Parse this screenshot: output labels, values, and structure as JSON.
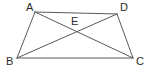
{
  "figure": {
    "kind": "geometry-diagram",
    "shape_name": "quadrilateral",
    "canvas": {
      "width": 148,
      "height": 72
    },
    "background_color": "#ffffff",
    "stroke_color": "#5a5a5a",
    "label_color": "#2b2b2b",
    "points": [
      {
        "id": "A",
        "label": "A",
        "x": 35,
        "y": 12,
        "label_x": 26,
        "label_y": 2
      },
      {
        "id": "D",
        "label": "D",
        "x": 117,
        "y": 14,
        "label_x": 120,
        "label_y": 2
      },
      {
        "id": "B",
        "label": "B",
        "x": 17,
        "y": 58,
        "label_x": 6,
        "label_y": 56
      },
      {
        "id": "C",
        "label": "C",
        "x": 133,
        "y": 58,
        "label_x": 136,
        "label_y": 56
      },
      {
        "id": "E",
        "label": "E",
        "x": 74,
        "y": 34,
        "label_x": 71,
        "label_y": 16
      }
    ],
    "segments": [
      {
        "id": "AD",
        "from": "A",
        "to": "D",
        "role": "side"
      },
      {
        "id": "AB",
        "from": "A",
        "to": "B",
        "role": "side"
      },
      {
        "id": "DC",
        "from": "D",
        "to": "C",
        "role": "side"
      },
      {
        "id": "BC",
        "from": "B",
        "to": "C",
        "role": "side"
      },
      {
        "id": "AC",
        "from": "A",
        "to": "C",
        "role": "diagonal"
      },
      {
        "id": "BD",
        "from": "B",
        "to": "D",
        "role": "diagonal"
      }
    ],
    "intersection": {
      "id": "E",
      "of": [
        "AC",
        "BD"
      ]
    }
  }
}
